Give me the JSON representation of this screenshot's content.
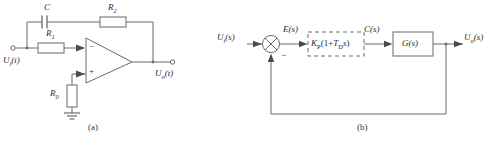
{
  "figure": {
    "panels": [
      {
        "caption": "(a)",
        "type": "op-amp-circuit",
        "components": {
          "capacitor": "C",
          "feedback_resistor": "R2",
          "input_resistor": "R1",
          "bias_resistor": "R0",
          "input_label": "Ui(t)",
          "output_label": "Uo(t)",
          "inverting_input_sign": "−",
          "noninverting_input_sign": "+",
          "ground": "ground-symbol"
        },
        "labels": {
          "C": "C",
          "R2_base": "R",
          "R2_sub": "2",
          "R1_base": "R",
          "R1_sub": "1",
          "R0_base": "R",
          "R0_sub": "0",
          "Ui_base": "U",
          "Ui_sub": "i",
          "Ui_arg": "(t)",
          "Uo_base": "U",
          "Uo_sub": "o",
          "Uo_arg": "(t)"
        }
      },
      {
        "caption": "(b)",
        "type": "block-diagram",
        "blocks": {
          "controller": "KP(1+TDs)",
          "plant": "G(s)"
        },
        "signals": {
          "input": "Ui(s)",
          "error": "E(s)",
          "control": "C(s)",
          "output": "Uo(s)",
          "feedback_sign": "−"
        },
        "labels": {
          "Ui_base": "U",
          "Ui_sub": "i",
          "Ui_arg": "(s)",
          "E": "E(s)",
          "Kp_base": "K",
          "Kp_sub": "P",
          "ctrl_open": "(1+",
          "T_base": "T",
          "T_sub": "D",
          "ctrl_s": "s",
          "ctrl_close": ")",
          "C": "C(s)",
          "G": "G(s)",
          "Uo_base": "U",
          "Uo_sub": "o",
          "Uo_arg": "(s)",
          "minus": "−"
        },
        "summing_junction": "circle-with-cross"
      }
    ]
  },
  "colors": {
    "line": "#6b6b6b",
    "text": "#2b2b2b",
    "caption": "#333333",
    "background": "#ffffff"
  }
}
